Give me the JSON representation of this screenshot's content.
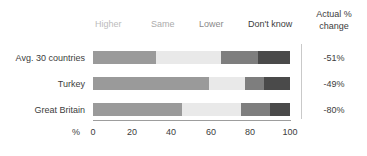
{
  "chart_data": {
    "type": "bar",
    "subtype": "stacked-horizontal-100pct",
    "title": "",
    "xlabel": "%",
    "ylabel": "",
    "xlim": [
      0,
      100
    ],
    "grid": false,
    "legend_position": "top",
    "categories": [
      "Avg. 30 countries",
      "Turkey",
      "Great Britain"
    ],
    "series": [
      {
        "name": "Higher",
        "color": "#9a9a9a",
        "values": [
          32,
          59,
          45
        ]
      },
      {
        "name": "Same",
        "color": "#e9e9e9",
        "values": [
          33,
          18,
          30
        ]
      },
      {
        "name": "Lower",
        "color": "#7e7e7e",
        "values": [
          19,
          10,
          15
        ]
      },
      {
        "name": "Don't know",
        "color": "#4a4a4a",
        "values": [
          16,
          13,
          10
        ]
      }
    ],
    "xticks": [
      0,
      20,
      40,
      60,
      80,
      100
    ],
    "xtick_labels": [
      "0",
      "20",
      "40",
      "60",
      "80",
      "100"
    ],
    "annotations": {
      "right_column_header": "Actual % change",
      "right_column_header_line1": "Actual %",
      "right_column_header_line2": "change",
      "right_column_values": [
        "-51%",
        "-49%",
        "-80%"
      ]
    }
  },
  "legend": {
    "items": [
      {
        "label": "Higher"
      },
      {
        "label": "Same"
      },
      {
        "label": "Lower"
      },
      {
        "label": "Don't know"
      }
    ]
  },
  "axis": {
    "unit_label": "%",
    "ticks": [
      "0",
      "20",
      "40",
      "60",
      "80",
      "100"
    ]
  },
  "rows": [
    {
      "label": "Avg. 30 countries",
      "actual_change": "-51%"
    },
    {
      "label": "Turkey",
      "actual_change": "-49%"
    },
    {
      "label": "Great Britain",
      "actual_change": "-80%"
    }
  ],
  "right_panel": {
    "header_line1": "Actual %",
    "header_line2": "change"
  }
}
